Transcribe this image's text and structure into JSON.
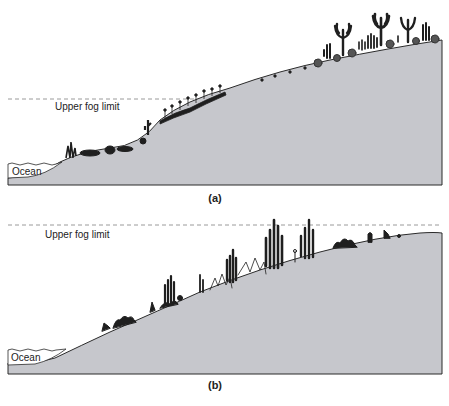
{
  "panels": [
    {
      "id": "a",
      "caption": "(a)",
      "fog_label": "Upper fog limit",
      "ocean_label": "Ocean"
    },
    {
      "id": "b",
      "caption": "(b)",
      "fog_label": "Upper fog limit",
      "ocean_label": "Ocean"
    }
  ],
  "colors": {
    "ground": "#c6c7cc",
    "outline": "#2b2b2b",
    "vegetation": "#1f1f1f",
    "fog_line": "#9a9a9a",
    "text": "#222222"
  }
}
